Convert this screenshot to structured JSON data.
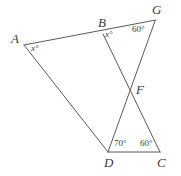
{
  "figure": {
    "type": "geometry-diagram",
    "stroke_color": "#5a5a5a",
    "text_color": "#3b3b3b",
    "background_color": "#ffffff",
    "width": 181,
    "height": 176
  },
  "vertices": [
    {
      "id": "A",
      "label": "A",
      "x": 24,
      "y": 45
    },
    {
      "id": "B",
      "label": "B",
      "x": 103,
      "y": 33
    },
    {
      "id": "G",
      "label": "G",
      "x": 156,
      "y": 20
    },
    {
      "id": "F",
      "label": "F",
      "x": 131,
      "y": 88
    },
    {
      "id": "D",
      "label": "D",
      "x": 108,
      "y": 152
    },
    {
      "id": "C",
      "label": "C",
      "x": 160,
      "y": 152
    }
  ],
  "vertex_labels": [
    {
      "text": "A",
      "left": 11,
      "top": 32
    },
    {
      "text": "B",
      "left": 98,
      "top": 16
    },
    {
      "text": "G",
      "left": 152,
      "top": 3
    },
    {
      "text": "F",
      "left": 136,
      "top": 83
    },
    {
      "text": "D",
      "left": 104,
      "top": 156
    },
    {
      "text": "C",
      "left": 157,
      "top": 156
    }
  ],
  "segments": [
    {
      "id": "A-G",
      "from": "A",
      "to": "G",
      "note": "top line passing through B"
    },
    {
      "id": "A-D",
      "from": "A",
      "to": "D",
      "note": "left descending line"
    },
    {
      "id": "B-C",
      "from": "B",
      "to": "C",
      "note": "passes through F"
    },
    {
      "id": "G-D",
      "from": "G",
      "to": "D",
      "note": "passes through F"
    },
    {
      "id": "D-C",
      "from": "D",
      "to": "C",
      "note": "bottom base line"
    }
  ],
  "angles": [
    {
      "id": "angle-A",
      "vertex": "A",
      "value": "x",
      "unit": "°",
      "text": "x°",
      "variable": true,
      "left": 31,
      "top": 44
    },
    {
      "id": "angle-B",
      "vertex": "B",
      "value": "x",
      "unit": "°",
      "text": "x°",
      "variable": true,
      "left": 105,
      "top": 30
    },
    {
      "id": "angle-G",
      "vertex": "G",
      "value": "60",
      "unit": "°",
      "text": "60°",
      "variable": false,
      "left": 132,
      "top": 25
    },
    {
      "id": "angle-D",
      "vertex": "D",
      "value": "70",
      "unit": "°",
      "text": "70°",
      "variable": false,
      "left": 114,
      "top": 139
    },
    {
      "id": "angle-C",
      "vertex": "C",
      "value": "60",
      "unit": "°",
      "text": "60°",
      "variable": false,
      "left": 140,
      "top": 139
    }
  ]
}
